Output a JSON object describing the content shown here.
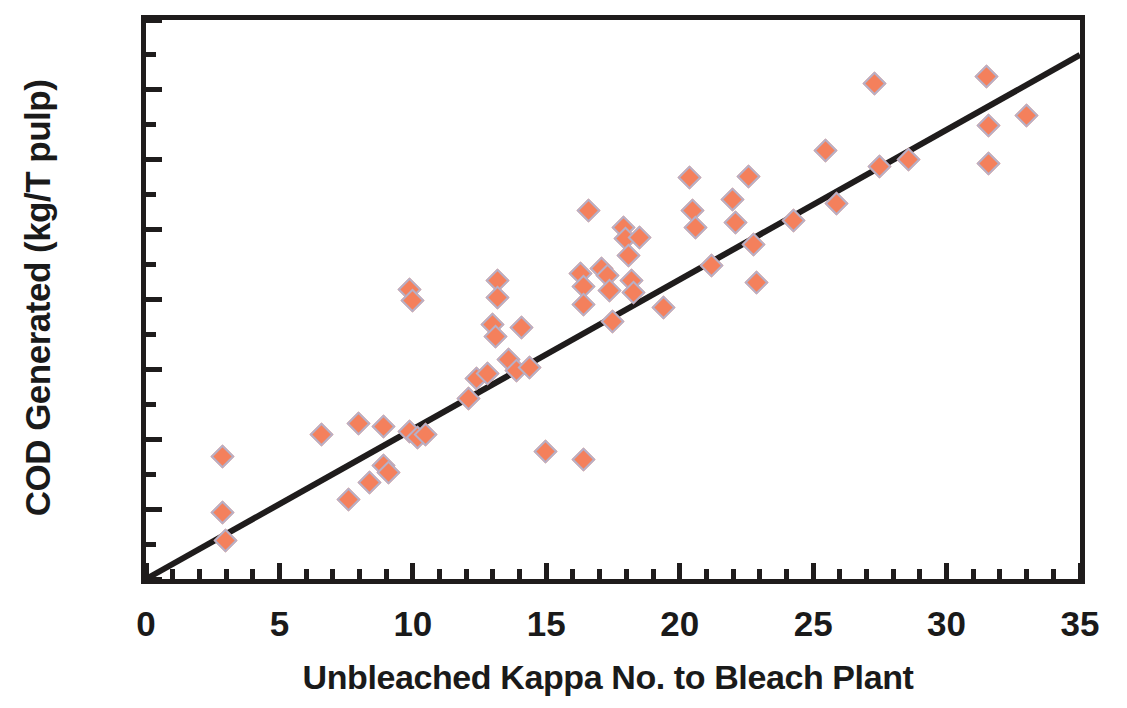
{
  "chart_data": {
    "type": "scatter",
    "title": "",
    "xlabel": "Unbleached Kappa No. to Bleach Plant",
    "ylabel": "COD Generated (kg/T pulp)",
    "xlim": [
      0,
      35
    ],
    "ylim": [
      0,
      80
    ],
    "xticks": [
      0,
      5,
      10,
      15,
      20,
      25,
      30,
      35
    ],
    "yticks": [
      0,
      10,
      20,
      30,
      40,
      50,
      60,
      70,
      80
    ],
    "x_minor_step": 1,
    "y_minor_step": 5,
    "grid": false,
    "legend": null,
    "marker": {
      "shape": "diamond",
      "fill_color": "#F4805C",
      "edge_color": "#B6B0C8"
    },
    "trendline": {
      "type": "linear",
      "color": "#1F1C1C",
      "x": [
        0,
        35
      ],
      "y": [
        0,
        75
      ],
      "slope": 2.143,
      "intercept": 0
    },
    "points": [
      {
        "x": 2.9,
        "y": 17.4
      },
      {
        "x": 2.9,
        "y": 9.4
      },
      {
        "x": 3.0,
        "y": 5.4
      },
      {
        "x": 6.6,
        "y": 20.6
      },
      {
        "x": 7.6,
        "y": 11.3
      },
      {
        "x": 8.0,
        "y": 22.2
      },
      {
        "x": 8.4,
        "y": 13.7
      },
      {
        "x": 8.9,
        "y": 21.8
      },
      {
        "x": 8.9,
        "y": 16.2
      },
      {
        "x": 9.1,
        "y": 15.2
      },
      {
        "x": 9.9,
        "y": 41.4
      },
      {
        "x": 10.0,
        "y": 39.8
      },
      {
        "x": 9.9,
        "y": 21.0
      },
      {
        "x": 10.2,
        "y": 20.2
      },
      {
        "x": 10.5,
        "y": 20.6
      },
      {
        "x": 12.1,
        "y": 25.7
      },
      {
        "x": 12.4,
        "y": 28.6
      },
      {
        "x": 12.8,
        "y": 29.4
      },
      {
        "x": 13.0,
        "y": 36.3
      },
      {
        "x": 13.1,
        "y": 34.6
      },
      {
        "x": 13.2,
        "y": 42.6
      },
      {
        "x": 13.2,
        "y": 40.2
      },
      {
        "x": 13.6,
        "y": 31.4
      },
      {
        "x": 13.9,
        "y": 29.8
      },
      {
        "x": 14.1,
        "y": 35.9
      },
      {
        "x": 14.4,
        "y": 30.2
      },
      {
        "x": 15.0,
        "y": 18.2
      },
      {
        "x": 16.4,
        "y": 17.0
      },
      {
        "x": 16.3,
        "y": 43.7
      },
      {
        "x": 16.4,
        "y": 41.8
      },
      {
        "x": 16.4,
        "y": 39.2
      },
      {
        "x": 16.6,
        "y": 52.6
      },
      {
        "x": 17.1,
        "y": 44.3
      },
      {
        "x": 17.3,
        "y": 43.4
      },
      {
        "x": 17.4,
        "y": 41.2
      },
      {
        "x": 17.5,
        "y": 36.8
      },
      {
        "x": 17.9,
        "y": 50.3
      },
      {
        "x": 18.0,
        "y": 48.6
      },
      {
        "x": 18.1,
        "y": 46.2
      },
      {
        "x": 18.2,
        "y": 42.6
      },
      {
        "x": 18.3,
        "y": 41.0
      },
      {
        "x": 18.5,
        "y": 48.8
      },
      {
        "x": 19.4,
        "y": 38.8
      },
      {
        "x": 20.4,
        "y": 57.4
      },
      {
        "x": 20.5,
        "y": 52.6
      },
      {
        "x": 20.6,
        "y": 50.2
      },
      {
        "x": 21.2,
        "y": 44.8
      },
      {
        "x": 22.0,
        "y": 54.2
      },
      {
        "x": 22.1,
        "y": 51.0
      },
      {
        "x": 22.6,
        "y": 57.5
      },
      {
        "x": 22.8,
        "y": 47.8
      },
      {
        "x": 22.9,
        "y": 42.3
      },
      {
        "x": 24.3,
        "y": 51.3
      },
      {
        "x": 25.5,
        "y": 61.2
      },
      {
        "x": 25.9,
        "y": 53.6
      },
      {
        "x": 27.3,
        "y": 70.8
      },
      {
        "x": 27.5,
        "y": 59.0
      },
      {
        "x": 28.6,
        "y": 60.0
      },
      {
        "x": 31.5,
        "y": 71.9
      },
      {
        "x": 31.6,
        "y": 64.9
      },
      {
        "x": 31.6,
        "y": 59.4
      },
      {
        "x": 33.0,
        "y": 66.2
      }
    ]
  }
}
